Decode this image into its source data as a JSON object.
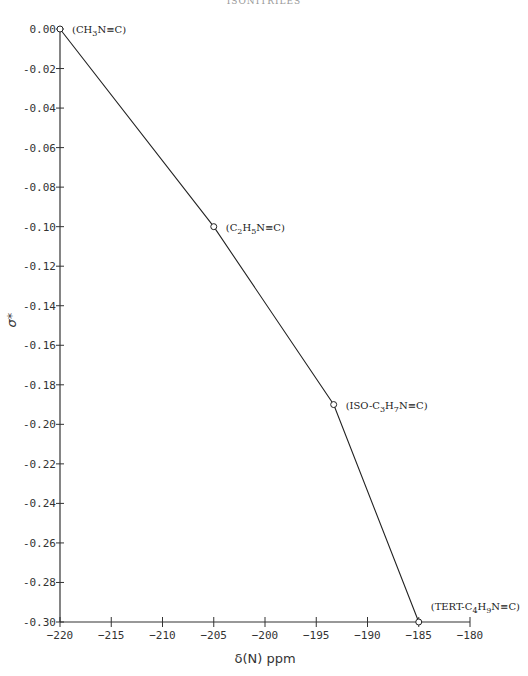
{
  "header": {
    "title": "ISONITRILES"
  },
  "chart_data": {
    "type": "line",
    "title": "",
    "xlabel": "δ(N) ppm",
    "ylabel": "σ*",
    "xlim": [
      -220,
      -180
    ],
    "ylim": [
      -0.3,
      0.0
    ],
    "grid": false,
    "x_ticks": [
      -220,
      -215,
      -210,
      -205,
      -200,
      -195,
      -190,
      -185,
      -180
    ],
    "x_tick_labels": [
      "−220",
      "−215",
      "−210",
      "−205",
      "−200",
      "−195",
      "−190",
      "−185",
      "−180"
    ],
    "y_ticks": [
      0.0,
      -0.02,
      -0.04,
      -0.06,
      -0.08,
      -0.1,
      -0.12,
      -0.14,
      -0.16,
      -0.18,
      -0.2,
      -0.22,
      -0.24,
      -0.26,
      -0.28,
      -0.3
    ],
    "y_tick_labels": [
      "0.00",
      "-0.02",
      "-0.04",
      "-0.06",
      "-0.08",
      "-0.10",
      "-0.12",
      "-0.14",
      "-0.16",
      "-0.18",
      "-0.20",
      "-0.22",
      "-0.24",
      "-0.26",
      "-0.28",
      "-0.30"
    ],
    "series": [
      {
        "name": "Isonitriles",
        "marker": "open-circle",
        "points": [
          {
            "x": -220.0,
            "y": 0.0,
            "label": "(CH3N≡C)",
            "label_parts": [
              [
                "(CH",
                ""
              ],
              [
                "3",
                "sub"
              ],
              [
                "N≡C)",
                ""
              ]
            ]
          },
          {
            "x": -205.0,
            "y": -0.1,
            "label": "(C2H5N≡C)",
            "label_parts": [
              [
                "(C",
                ""
              ],
              [
                "2",
                "sub"
              ],
              [
                "H",
                ""
              ],
              [
                "5",
                "sub"
              ],
              [
                "N≡C)",
                ""
              ]
            ]
          },
          {
            "x": -193.3,
            "y": -0.19,
            "label": "(ISO-C3H7N≡C)",
            "label_parts": [
              [
                "(ISO-C",
                ""
              ],
              [
                "3",
                "sub"
              ],
              [
                "H",
                ""
              ],
              [
                "7",
                "sub"
              ],
              [
                "N≡C)",
                ""
              ]
            ]
          },
          {
            "x": -185.0,
            "y": -0.3,
            "label": "(TERT-C4H9N≡C)",
            "label_parts": [
              [
                "(TERT-C",
                ""
              ],
              [
                "4",
                "sub"
              ],
              [
                "H",
                ""
              ],
              [
                "9",
                "sub"
              ],
              [
                "N≡C)",
                ""
              ]
            ]
          }
        ]
      }
    ]
  }
}
